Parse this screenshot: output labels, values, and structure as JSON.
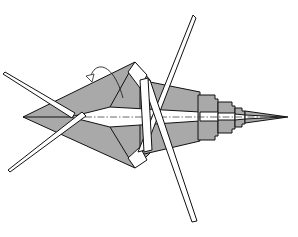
{
  "diagram": {
    "subject": "origami insect (cricket/grasshopper) folding step",
    "colors": {
      "paper_colored": "#a9a9a9",
      "paper_white": "#ffffff",
      "line": "#111111",
      "background": "#ffffff"
    },
    "elements": [
      {
        "name": "body",
        "description": "grey diamond-shaped body with white center strip"
      },
      {
        "name": "tail",
        "description": "stepped pleated tail ending in a point at right"
      },
      {
        "name": "antennae",
        "description": "two long thin crossing white legs/antennae at left"
      },
      {
        "name": "long-legs",
        "description": "two long thin crossing white legs through the middle"
      },
      {
        "name": "valley-fold-line",
        "description": "dash-dot centerline along the body"
      },
      {
        "name": "turn-over-arrow",
        "description": "small curved arrow near the top-left of the body"
      }
    ]
  }
}
